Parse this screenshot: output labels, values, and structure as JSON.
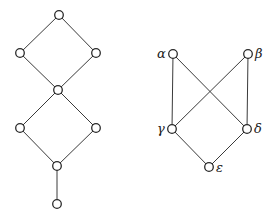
{
  "diagrams": [
    {
      "name": "left-lattice",
      "nodes": [
        {
          "id": "a1",
          "x": 59,
          "y": 15,
          "label": ""
        },
        {
          "id": "a2",
          "x": 20,
          "y": 53,
          "label": ""
        },
        {
          "id": "a3",
          "x": 96,
          "y": 53,
          "label": ""
        },
        {
          "id": "a4",
          "x": 58,
          "y": 90,
          "label": ""
        },
        {
          "id": "a5",
          "x": 20,
          "y": 128,
          "label": ""
        },
        {
          "id": "a6",
          "x": 96,
          "y": 128,
          "label": ""
        },
        {
          "id": "a7",
          "x": 57,
          "y": 166,
          "label": ""
        },
        {
          "id": "a8",
          "x": 57,
          "y": 204,
          "label": ""
        }
      ],
      "edges": [
        [
          "a1",
          "a2"
        ],
        [
          "a1",
          "a3"
        ],
        [
          "a2",
          "a4"
        ],
        [
          "a3",
          "a4"
        ],
        [
          "a4",
          "a5"
        ],
        [
          "a4",
          "a6"
        ],
        [
          "a5",
          "a7"
        ],
        [
          "a6",
          "a7"
        ],
        [
          "a7",
          "a8"
        ]
      ]
    },
    {
      "name": "right-poset",
      "nodes": [
        {
          "id": "alpha",
          "x": 173,
          "y": 54,
          "label": "α",
          "lx": 157,
          "ly": 58
        },
        {
          "id": "beta",
          "x": 248,
          "y": 54,
          "label": "β",
          "lx": 255,
          "ly": 58
        },
        {
          "id": "gamma",
          "x": 172,
          "y": 129,
          "label": "γ",
          "lx": 157,
          "ly": 133
        },
        {
          "id": "delta",
          "x": 247,
          "y": 129,
          "label": "δ",
          "lx": 254,
          "ly": 133
        },
        {
          "id": "epsilon",
          "x": 209,
          "y": 167,
          "label": "ε",
          "lx": 216,
          "ly": 172
        }
      ],
      "edges": [
        [
          "alpha",
          "gamma"
        ],
        [
          "alpha",
          "delta"
        ],
        [
          "beta",
          "gamma"
        ],
        [
          "beta",
          "delta"
        ],
        [
          "gamma",
          "epsilon"
        ],
        [
          "delta",
          "epsilon"
        ]
      ]
    }
  ],
  "labels": {
    "alpha": "α",
    "beta": "β",
    "gamma": "γ",
    "delta": "δ",
    "epsilon": "ε"
  }
}
